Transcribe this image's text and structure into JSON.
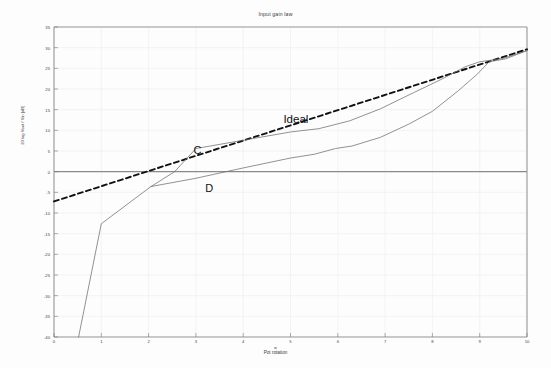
{
  "chart_data": {
    "type": "line",
    "title": "Input gain law",
    "xlabel": "Pot rotation",
    "xlabel_symbol": "α",
    "ylabel": "Gain",
    "ylabel_numerator": "Vout",
    "ylabel_denominator": "Vin",
    "ylabel_full": "20 log  Vout / Vin   [dB]",
    "xlim": [
      0,
      10
    ],
    "ylim": [
      -40,
      35
    ],
    "xticks": [
      "0",
      "1",
      "2",
      "3",
      "4",
      "5",
      "6",
      "7",
      "8",
      "9",
      "10"
    ],
    "yticks": [
      "35",
      "30",
      "25",
      "20",
      "15",
      "10",
      "5",
      "0",
      "-5",
      "-10",
      "-15",
      "-20",
      "-25",
      "-30",
      "-35",
      "-40"
    ],
    "grid": true,
    "legend": "inline-annotations",
    "annotations": [
      {
        "text": "Ideal",
        "x": 4.85,
        "y": 14.2
      },
      {
        "text": "C",
        "x": 2.95,
        "y": 6.7
      },
      {
        "text": "D",
        "x": 3.2,
        "y": -2.6
      }
    ],
    "series": [
      {
        "name": "Ideal",
        "style": "dashed",
        "color": "#111111",
        "points": [
          [
            0,
            -7.2
          ],
          [
            10,
            29.6
          ]
        ]
      },
      {
        "name": "C",
        "style": "solid",
        "color": "#6e6e6e",
        "points": [
          [
            0.52,
            -40.0
          ],
          [
            1.0,
            -12.6
          ],
          [
            2.05,
            -3.6
          ],
          [
            2.55,
            0.0
          ],
          [
            3.0,
            5.6
          ],
          [
            3.55,
            6.7
          ],
          [
            4.3,
            8.2
          ],
          [
            5.0,
            9.6
          ],
          [
            5.6,
            10.4
          ],
          [
            6.25,
            12.3
          ],
          [
            6.9,
            15.2
          ],
          [
            7.6,
            19.1
          ],
          [
            8.2,
            22.4
          ],
          [
            8.7,
            25.4
          ],
          [
            9.0,
            26.6
          ],
          [
            9.5,
            27.4
          ],
          [
            10,
            29.3
          ]
        ]
      },
      {
        "name": "D",
        "style": "solid",
        "color": "#6e6e6e",
        "points": [
          [
            2.05,
            -3.6
          ],
          [
            3.0,
            -1.6
          ],
          [
            4.0,
            0.9
          ],
          [
            5.0,
            3.3
          ],
          [
            5.5,
            4.2
          ],
          [
            5.95,
            5.6
          ],
          [
            6.3,
            6.2
          ],
          [
            6.9,
            8.3
          ],
          [
            7.5,
            11.5
          ],
          [
            8.0,
            14.6
          ],
          [
            8.55,
            19.6
          ],
          [
            8.95,
            23.6
          ],
          [
            9.2,
            26.6
          ],
          [
            9.55,
            27.3
          ],
          [
            10,
            29.3
          ]
        ]
      }
    ]
  },
  "axes": {
    "plot_left": 54,
    "plot_right": 527,
    "plot_top": 27,
    "plot_bottom": 337,
    "zero_line_color": "#8a8a8a",
    "grid_color": "#ececf2",
    "frame_color": "#9a9a9a"
  }
}
